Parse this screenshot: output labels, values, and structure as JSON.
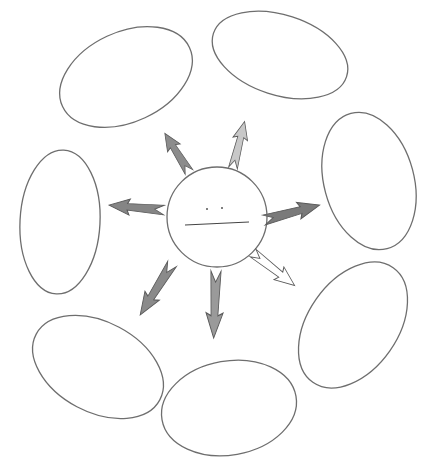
{
  "diagram": {
    "type": "cluster-web-graphic-organizer",
    "center": {
      "shape": "circle",
      "cx": 217,
      "cy": 217,
      "r": 50,
      "label": "",
      "has_writing_line": true,
      "dots": 2
    },
    "bubbles": [
      {
        "id": "top-left",
        "cx": 126,
        "cy": 77,
        "rx": 70,
        "ry": 45,
        "rotate": -25,
        "label": ""
      },
      {
        "id": "top-right",
        "cx": 280,
        "cy": 55,
        "rx": 70,
        "ry": 40,
        "rotate": 18,
        "label": ""
      },
      {
        "id": "right",
        "cx": 369,
        "cy": 181,
        "rx": 45,
        "ry": 70,
        "rotate": -15,
        "label": ""
      },
      {
        "id": "bottom-right",
        "cx": 353,
        "cy": 325,
        "rx": 45,
        "ry": 70,
        "rotate": 35,
        "label": ""
      },
      {
        "id": "bottom",
        "cx": 229,
        "cy": 408,
        "rx": 68,
        "ry": 47,
        "rotate": -10,
        "label": ""
      },
      {
        "id": "bottom-left",
        "cx": 98,
        "cy": 367,
        "rx": 70,
        "ry": 45,
        "rotate": 28,
        "label": ""
      },
      {
        "id": "left",
        "cx": 60,
        "cy": 222,
        "rx": 40,
        "ry": 72,
        "rotate": 3,
        "label": ""
      }
    ],
    "arrows": [
      {
        "id": "to-top-left",
        "fill": "#8c8c8c"
      },
      {
        "id": "to-top-right",
        "fill": "#c8c8c8"
      },
      {
        "id": "to-right",
        "fill": "#7a7a7a"
      },
      {
        "id": "to-bottom-right",
        "fill": "#ffffff"
      },
      {
        "id": "to-bottom",
        "fill": "#9a9a9a"
      },
      {
        "id": "to-bottom-left",
        "fill": "#8a8a8a"
      },
      {
        "id": "to-left",
        "fill": "#858585"
      }
    ],
    "colors": {
      "outline": "#6e6e6e",
      "background": "#ffffff"
    }
  }
}
